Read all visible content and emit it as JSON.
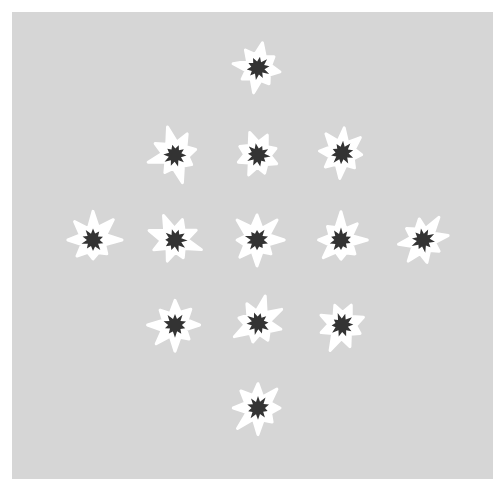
{
  "canvas": {
    "width": 504,
    "height": 491,
    "background": "#ffffff"
  },
  "panel": {
    "x": 12,
    "y": 12,
    "width": 481,
    "height": 467,
    "color": "#d6d6d6"
  },
  "colors": {
    "outer": "#ffffff",
    "inner": "#333333"
  },
  "stars": [
    {
      "x": 258,
      "y": 68,
      "rot": 10
    },
    {
      "x": 175,
      "y": 155,
      "rot": -15
    },
    {
      "x": 258,
      "y": 155,
      "rot": 25
    },
    {
      "x": 342,
      "y": 153,
      "rot": 5
    },
    {
      "x": 93,
      "y": 240,
      "rot": 0
    },
    {
      "x": 175,
      "y": 240,
      "rot": 20
    },
    {
      "x": 257,
      "y": 240,
      "rot": 0
    },
    {
      "x": 341,
      "y": 240,
      "rot": 0
    },
    {
      "x": 423,
      "y": 240,
      "rot": -10
    },
    {
      "x": 175,
      "y": 325,
      "rot": 0
    },
    {
      "x": 258,
      "y": 323,
      "rot": 15
    },
    {
      "x": 342,
      "y": 325,
      "rot": -20
    },
    {
      "x": 258,
      "y": 408,
      "rot": 0
    }
  ]
}
